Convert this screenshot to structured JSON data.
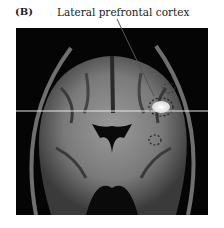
{
  "figure": {
    "panel_label": "(B)",
    "annotation": "Lateral prefrontal cortex",
    "image_description": "Coronal MRI brain slice with highlighted region in lateral prefrontal cortex"
  }
}
